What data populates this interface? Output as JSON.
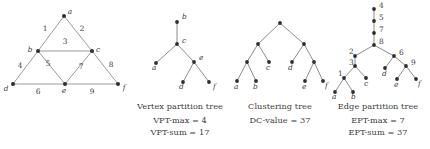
{
  "figure": {
    "panels": [
      {
        "id": "graph",
        "caption_title": "",
        "caption_stat1": "",
        "caption_stat2": ""
      },
      {
        "id": "vpt",
        "caption_title": "Vertex partition tree",
        "caption_stat1": "VPT-max = 4",
        "caption_stat2": "VPT-sum = 17"
      },
      {
        "id": "ct",
        "caption_title": "Clustering tree",
        "caption_stat1": "DC-value = 37",
        "caption_stat2": ""
      },
      {
        "id": "ept",
        "caption_title": "Edge partition tree",
        "caption_stat1": "EPT-max = 7",
        "caption_stat2": "EPT-sum = 37"
      }
    ]
  },
  "graph": {
    "vertices": [
      {
        "id": "a",
        "label": "a",
        "x": 64,
        "y": 16
      },
      {
        "id": "b",
        "label": "b",
        "x": 38,
        "y": 51
      },
      {
        "id": "c",
        "label": "c",
        "x": 92,
        "y": 51
      },
      {
        "id": "d",
        "label": "d",
        "x": 13,
        "y": 84
      },
      {
        "id": "e",
        "label": "e",
        "x": 65,
        "y": 84
      },
      {
        "id": "f",
        "label": "f",
        "x": 118,
        "y": 84
      }
    ],
    "edges": [
      {
        "id": "1",
        "label": "1",
        "from": "a",
        "to": "b",
        "lx": 45,
        "ly": 31
      },
      {
        "id": "2",
        "label": "2",
        "from": "a",
        "to": "c",
        "lx": 82,
        "ly": 31
      },
      {
        "id": "3",
        "label": "3",
        "from": "b",
        "to": "c",
        "lx": 65,
        "ly": 44
      },
      {
        "id": "4",
        "label": "4",
        "from": "b",
        "to": "d",
        "lx": 20,
        "ly": 68
      },
      {
        "id": "5",
        "label": "5",
        "from": "b",
        "to": "e",
        "lx": 48,
        "ly": 66
      },
      {
        "id": "6",
        "label": "6",
        "from": "d",
        "to": "e",
        "lx": 38,
        "ly": 94
      },
      {
        "id": "7",
        "label": "7",
        "from": "c",
        "to": "e",
        "lx": 81,
        "ly": 69
      },
      {
        "id": "8",
        "label": "8",
        "from": "c",
        "to": "f",
        "lx": 111,
        "ly": 67
      },
      {
        "id": "9",
        "label": "9",
        "from": "e",
        "to": "f",
        "lx": 92,
        "ly": 94
      }
    ]
  },
  "vertex_partition_tree": {
    "nodes": [
      {
        "id": "b",
        "label": "b",
        "x": 49,
        "y": 22,
        "lx": 54,
        "ly": 19
      },
      {
        "id": "c",
        "label": "c",
        "x": 49,
        "y": 44,
        "lx": 54,
        "ly": 43
      },
      {
        "id": "a",
        "label": "a",
        "x": 28,
        "y": 63,
        "lx": 24,
        "ly": 70
      },
      {
        "id": "e",
        "label": "e",
        "x": 66,
        "y": 62,
        "lx": 71,
        "ly": 60
      },
      {
        "id": "d",
        "label": "d",
        "x": 55,
        "y": 82,
        "lx": 51,
        "ly": 89
      },
      {
        "id": "f",
        "label": "f",
        "x": 81,
        "y": 82,
        "lx": 85,
        "ly": 89
      }
    ],
    "edges": [
      [
        "b",
        "c"
      ],
      [
        "c",
        "a"
      ],
      [
        "c",
        "e"
      ],
      [
        "e",
        "d"
      ],
      [
        "e",
        "f"
      ]
    ]
  },
  "clustering_tree": {
    "nodes": [
      {
        "id": "r",
        "label": "",
        "x": 52,
        "y": 23,
        "lx": 0,
        "ly": 0
      },
      {
        "id": "n1",
        "label": "",
        "x": 30,
        "y": 44,
        "lx": 0,
        "ly": 0
      },
      {
        "id": "n2",
        "label": "",
        "x": 76,
        "y": 44,
        "lx": 0,
        "ly": 0
      },
      {
        "id": "n3",
        "label": "",
        "x": 19,
        "y": 62,
        "lx": 0,
        "ly": 0
      },
      {
        "id": "c",
        "label": "c",
        "x": 41,
        "y": 62,
        "lx": 38,
        "ly": 70
      },
      {
        "id": "d",
        "label": "d",
        "x": 64,
        "y": 62,
        "lx": 60,
        "ly": 70
      },
      {
        "id": "n4",
        "label": "",
        "x": 86,
        "y": 62,
        "lx": 0,
        "ly": 0
      },
      {
        "id": "a",
        "label": "a",
        "x": 9,
        "y": 81,
        "lx": 6,
        "ly": 89
      },
      {
        "id": "b",
        "label": "b",
        "x": 28,
        "y": 81,
        "lx": 25,
        "ly": 89
      },
      {
        "id": "e",
        "label": "e",
        "x": 77,
        "y": 81,
        "lx": 74,
        "ly": 89
      },
      {
        "id": "f",
        "label": "f",
        "x": 95,
        "y": 81,
        "lx": 97,
        "ly": 88
      }
    ],
    "edges": [
      [
        "r",
        "n1"
      ],
      [
        "r",
        "n2"
      ],
      [
        "n1",
        "n3"
      ],
      [
        "n1",
        "c"
      ],
      [
        "n2",
        "d"
      ],
      [
        "n2",
        "n4"
      ],
      [
        "n3",
        "a"
      ],
      [
        "n3",
        "b"
      ],
      [
        "n4",
        "e"
      ],
      [
        "n4",
        "f"
      ]
    ]
  },
  "edge_partition_tree": {
    "nodes": [
      {
        "id": "t4",
        "label": "4",
        "x": 48,
        "y": 9,
        "lx": 53,
        "ly": 8
      },
      {
        "id": "t5",
        "label": "5",
        "x": 48,
        "y": 21,
        "lx": 53,
        "ly": 20
      },
      {
        "id": "t7",
        "label": "7",
        "x": 48,
        "y": 33,
        "lx": 53,
        "ly": 32
      },
      {
        "id": "t8",
        "label": "8",
        "x": 48,
        "y": 45,
        "lx": 53,
        "ly": 44
      },
      {
        "id": "t2",
        "label": "2",
        "x": 29,
        "y": 56,
        "lx": 23,
        "ly": 54
      },
      {
        "id": "t6",
        "label": "6",
        "x": 68,
        "y": 56,
        "lx": 73,
        "ly": 55
      },
      {
        "id": "t3",
        "label": "3",
        "x": 29,
        "y": 66,
        "lx": 23,
        "ly": 65
      },
      {
        "id": "t9",
        "label": "9",
        "x": 80,
        "y": 66,
        "lx": 85,
        "ly": 65
      },
      {
        "id": "d",
        "label": "d",
        "x": 59,
        "y": 68,
        "lx": 56,
        "ly": 76
      },
      {
        "id": "t1",
        "label": "1",
        "x": 18,
        "y": 78,
        "lx": 12,
        "ly": 76
      },
      {
        "id": "c",
        "label": "c",
        "x": 40,
        "y": 78,
        "lx": 38,
        "ly": 86
      },
      {
        "id": "e",
        "label": "e",
        "x": 71,
        "y": 79,
        "lx": 68,
        "ly": 87
      },
      {
        "id": "f",
        "label": "f",
        "x": 90,
        "y": 79,
        "lx": 92,
        "ly": 86
      },
      {
        "id": "a",
        "label": "a",
        "x": 9,
        "y": 92,
        "lx": 6,
        "ly": 99
      },
      {
        "id": "b",
        "label": "b",
        "x": 27,
        "y": 92,
        "lx": 25,
        "ly": 99
      }
    ],
    "edges": [
      [
        "t4",
        "t5"
      ],
      [
        "t5",
        "t7"
      ],
      [
        "t7",
        "t8"
      ],
      [
        "t8",
        "t2"
      ],
      [
        "t8",
        "t6"
      ],
      [
        "t2",
        "t3"
      ],
      [
        "t3",
        "t1"
      ],
      [
        "t3",
        "c"
      ],
      [
        "t6",
        "d"
      ],
      [
        "t6",
        "t9"
      ],
      [
        "t9",
        "e"
      ],
      [
        "t9",
        "f"
      ],
      [
        "t1",
        "a"
      ],
      [
        "t1",
        "b"
      ]
    ]
  }
}
